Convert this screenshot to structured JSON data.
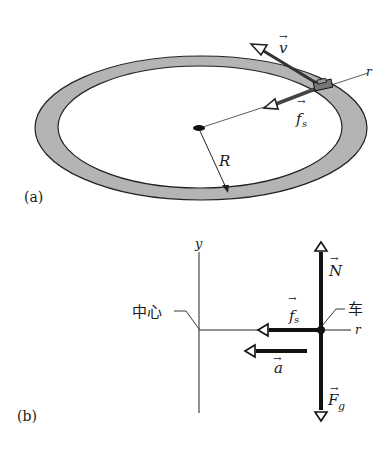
{
  "panel_a": {
    "label": "(a)",
    "vectors": {
      "velocity": {
        "symbol": "v",
        "arrow": "→"
      },
      "friction": {
        "symbol": "f",
        "subscript": "s",
        "arrow": "→"
      }
    },
    "axis_label": "r",
    "radius_label": "R",
    "colors": {
      "track": "#b4b4b4",
      "stroke": "#222222"
    }
  },
  "panel_b": {
    "label": "(b)",
    "y_axis_label": "y",
    "r_axis_label": "r",
    "center_label": "中心",
    "car_label": "车",
    "vectors": {
      "normal": {
        "symbol": "N",
        "arrow": "→"
      },
      "gravity": {
        "symbol": "F",
        "subscript": "g",
        "arrow": "→"
      },
      "friction": {
        "symbol": "f",
        "subscript": "s",
        "arrow": "→"
      },
      "acceleration": {
        "symbol": "a",
        "arrow": "→"
      }
    }
  }
}
